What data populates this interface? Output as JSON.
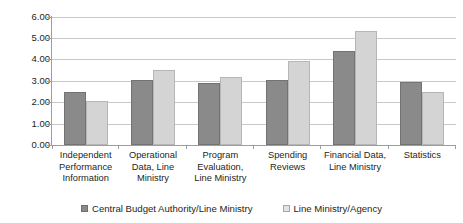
{
  "chart_data": {
    "type": "bar",
    "title": "",
    "subtitle": "",
    "xlabel": "",
    "ylabel": "",
    "ylim": [
      0,
      6
    ],
    "ytick_labels": [
      "6.00",
      "5.00",
      "4.00",
      "3.00",
      "2.00",
      "1.00",
      "0.00"
    ],
    "ytick_values": [
      6,
      5,
      4,
      3,
      2,
      1,
      0
    ],
    "grid": true,
    "legend_position": "bottom",
    "categories": [
      "Independent Performance Information",
      "Operational Data, Line Ministry",
      "Program Evaluation, Line Ministry",
      "Spending Reviews",
      "Financial Data, Line Ministry",
      "Statistics"
    ],
    "series": [
      {
        "name": "Central Budget Authority/Line Ministry",
        "color": "#8a8a8a",
        "values": [
          2.5,
          3.05,
          2.9,
          3.05,
          4.4,
          2.95
        ]
      },
      {
        "name": "Line Ministry/Agency",
        "color": "#d4d4d4",
        "values": [
          2.05,
          3.5,
          3.2,
          3.95,
          5.35,
          2.5
        ]
      }
    ]
  },
  "colors": {
    "series_0": "#8a8a8a",
    "series_1": "#d4d4d4",
    "gridline": "#c9c9c9",
    "axis": "#9d9d9d",
    "text": "#231f20",
    "background": "#ffffff"
  }
}
